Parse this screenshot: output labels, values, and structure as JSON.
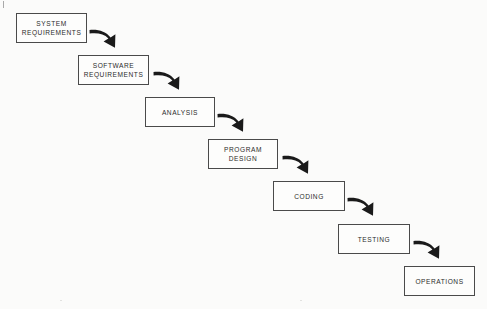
{
  "diagram": {
    "type": "flow-cascade",
    "background_color": "#fbfbfa",
    "box_border_color": "#4a4a4a",
    "arrow_color": "#1a1a1a",
    "text_color": "#2b2b2b",
    "stages": [
      {
        "id": "system-requirements",
        "label": "SYSTEM\nREQUIREMENTS",
        "x": 16,
        "y": 13,
        "w": 71,
        "h": 30
      },
      {
        "id": "software-requirements",
        "label": "SOFTWARE\nREQUIREMENTS",
        "x": 78,
        "y": 55,
        "w": 71,
        "h": 30
      },
      {
        "id": "analysis",
        "label": "ANALYSIS",
        "x": 145,
        "y": 97,
        "w": 70,
        "h": 30
      },
      {
        "id": "program-design",
        "label": "PROGRAM\nDESIGN",
        "x": 208,
        "y": 139,
        "w": 70,
        "h": 30
      },
      {
        "id": "coding",
        "label": "CODING",
        "x": 273,
        "y": 181,
        "w": 72,
        "h": 30
      },
      {
        "id": "testing",
        "label": "TESTING",
        "x": 338,
        "y": 224,
        "w": 72,
        "h": 30
      },
      {
        "id": "operations",
        "label": "OPERATIONS",
        "x": 404,
        "y": 266,
        "w": 71,
        "h": 30
      }
    ],
    "arrows": [
      {
        "id": "arrow-system-to-software",
        "from": "system-requirements",
        "to": "software-requirements",
        "x": 88,
        "y": 28
      },
      {
        "id": "arrow-software-to-analysis",
        "from": "software-requirements",
        "to": "analysis",
        "x": 152,
        "y": 70
      },
      {
        "id": "arrow-analysis-to-design",
        "from": "analysis",
        "to": "program-design",
        "x": 216,
        "y": 112
      },
      {
        "id": "arrow-design-to-coding",
        "from": "program-design",
        "to": "coding",
        "x": 281,
        "y": 154
      },
      {
        "id": "arrow-coding-to-testing",
        "from": "coding",
        "to": "testing",
        "x": 346,
        "y": 196
      },
      {
        "id": "arrow-testing-to-operations",
        "from": "testing",
        "to": "operations",
        "x": 412,
        "y": 239
      }
    ]
  }
}
